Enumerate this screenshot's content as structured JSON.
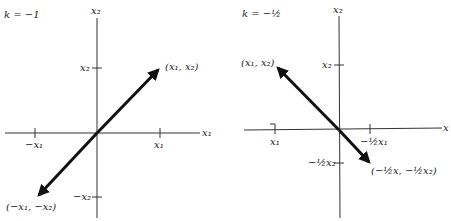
{
  "colors": {
    "axis": "#333333",
    "vector": "#111111",
    "text": "#222222",
    "background": "#ffffff"
  },
  "left": {
    "k_label": "k = −1",
    "axis_x_label": "x₁",
    "axis_y_label": "x₂",
    "ticks": {
      "x_pos": "x₁",
      "x_neg": "−x₁",
      "y_pos": "x₂",
      "y_neg": "−x₂"
    },
    "vector_head_label": "(x₁, x₂)",
    "vector_tail_label": "(−x₁, −x₂)"
  },
  "right": {
    "k_label": "k = −½",
    "axis_x_label": "x",
    "axis_y_label": "x₂",
    "ticks": {
      "x_left": "x₁",
      "x_right": "−½x₁",
      "y_pos": "x₂",
      "y_neg": "−½x₂"
    },
    "vector_head_label": "(x₁, x₂)",
    "vector_tail_label": "(−½x, −½x₂)"
  }
}
